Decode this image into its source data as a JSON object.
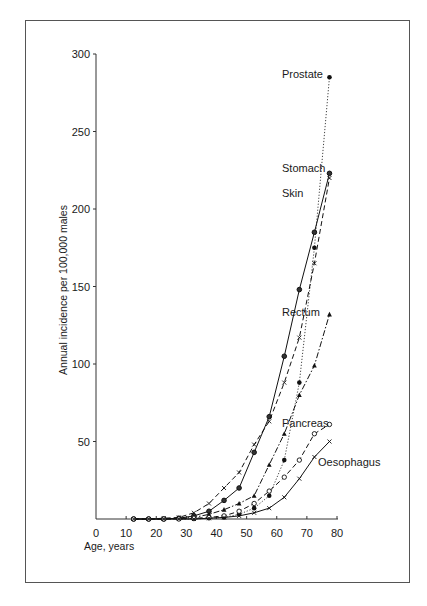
{
  "chart_data": {
    "type": "line",
    "title": "",
    "xlabel": "Age, years",
    "ylabel": "Annual incidence per 100,000 males",
    "xlim": [
      0,
      80
    ],
    "ylim": [
      0,
      300
    ],
    "x_ticks": [
      0,
      10,
      20,
      30,
      40,
      50,
      60,
      70,
      80
    ],
    "y_ticks": [
      50,
      100,
      150,
      200,
      250,
      300
    ],
    "grid": false,
    "legend": "inline labels at line ends",
    "x": [
      12.5,
      17.5,
      22.5,
      27.5,
      32.5,
      37.5,
      42.5,
      47.5,
      52.5,
      57.5,
      62.5,
      67.5,
      72.5,
      77.5
    ],
    "series": [
      {
        "name": "Prostate",
        "style": "dotted",
        "marker": "filled-circle",
        "values": [
          0,
          0,
          0,
          0,
          0,
          0.5,
          1,
          3,
          7,
          15,
          38,
          88,
          175,
          285
        ]
      },
      {
        "name": "Stomach",
        "style": "solid",
        "marker": "circle",
        "values": [
          0,
          0,
          0,
          0.5,
          2,
          5,
          12,
          20,
          43,
          66,
          105,
          148,
          185,
          223
        ]
      },
      {
        "name": "Skin",
        "style": "dashed",
        "marker": "x",
        "values": [
          0,
          0,
          0.5,
          1,
          4,
          10,
          20,
          30,
          48,
          63,
          88,
          117,
          165,
          220
        ]
      },
      {
        "name": "Rectum",
        "style": "dash-dot",
        "marker": "triangle",
        "values": [
          0,
          0,
          0,
          0.5,
          1,
          3,
          6,
          10,
          15,
          35,
          55,
          80,
          99,
          132
        ]
      },
      {
        "name": "Pancreas",
        "style": "dashed",
        "marker": "open-circle",
        "values": [
          0,
          0,
          0,
          0,
          0.5,
          1,
          2,
          5,
          10,
          18,
          27,
          38,
          55,
          61
        ]
      },
      {
        "name": "Oesophagus",
        "style": "solid",
        "marker": "x",
        "values": [
          0,
          0,
          0,
          0,
          0,
          0.5,
          1,
          2,
          4,
          7,
          14,
          26,
          40,
          50
        ]
      }
    ]
  },
  "labels": {
    "prostate": "Prostate",
    "stomach": "Stomach",
    "skin": "Skin",
    "rectum": "Rectum",
    "pancreas": "Pancreas",
    "oesophagus": "Oesophagus",
    "xlabel": "Age, years",
    "ylabel": "Annual incidence per 100,000 males"
  }
}
